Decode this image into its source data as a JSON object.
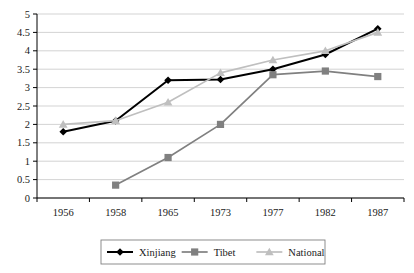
{
  "chart_data": {
    "type": "line",
    "title": "",
    "xlabel": "",
    "ylabel": "",
    "categories": [
      "1956",
      "1958",
      "1965",
      "1973",
      "1977",
      "1982",
      "1987"
    ],
    "ylim": [
      0,
      5
    ],
    "ytick_labels": [
      "0",
      "0.5",
      "1",
      "1.5",
      "2",
      "2.5",
      "3",
      "3.5",
      "4",
      "4.5",
      "5"
    ],
    "ytick_values": [
      0,
      0.5,
      1,
      1.5,
      2,
      2.5,
      3,
      3.5,
      4,
      4.5,
      5
    ],
    "grid": true,
    "legend_position": "bottom",
    "series": [
      {
        "name": "Xinjiang",
        "color": "#000000",
        "marker": "diamond",
        "values": [
          1.8,
          2.1,
          3.2,
          3.22,
          3.5,
          3.9,
          4.6
        ]
      },
      {
        "name": "Tibet",
        "color": "#808080",
        "marker": "square",
        "values": [
          null,
          0.35,
          1.1,
          2.0,
          3.35,
          3.45,
          3.3
        ]
      },
      {
        "name": "National",
        "color": "#bfbfbf",
        "marker": "triangle",
        "values": [
          2.0,
          2.1,
          2.6,
          3.4,
          3.75,
          4.0,
          4.5
        ]
      }
    ]
  },
  "axes": {
    "axis_color": "#000000",
    "grid_color": "#c8c8c8"
  },
  "legend": {
    "border_color": "#808080",
    "entries": [
      {
        "label": "Xinjiang"
      },
      {
        "label": "Tibet"
      },
      {
        "label": "National"
      }
    ]
  }
}
